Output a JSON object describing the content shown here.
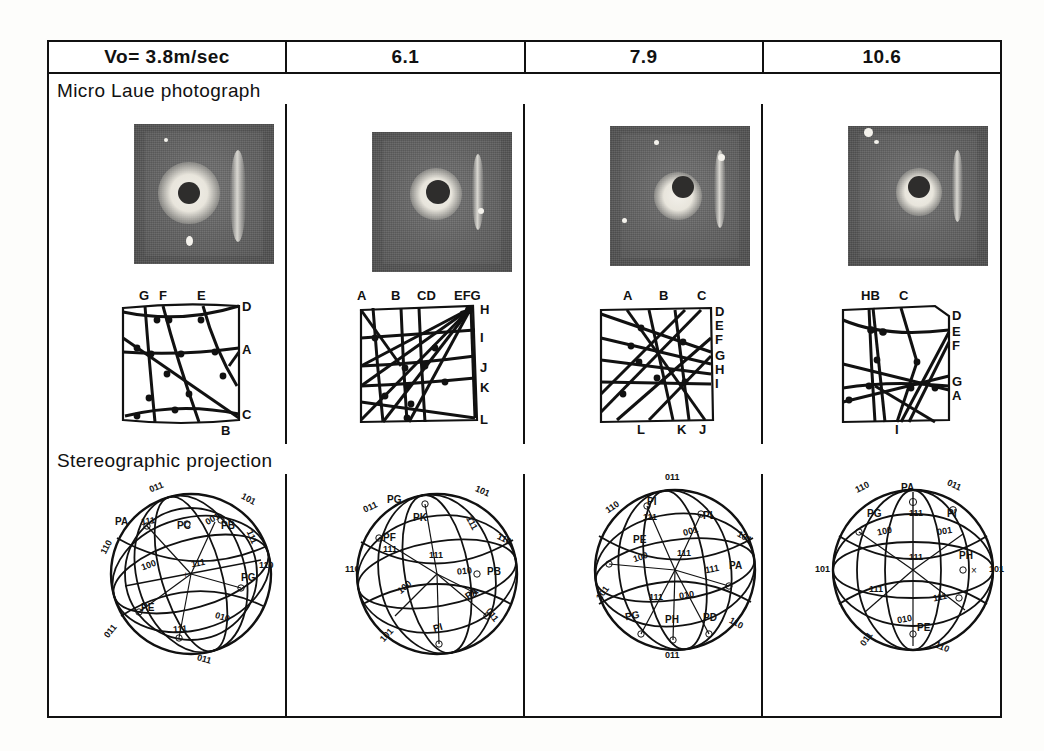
{
  "figure": {
    "columns": [
      {
        "header": "Vo= 3.8m/sec"
      },
      {
        "header": "6.1"
      },
      {
        "header": "7.9"
      },
      {
        "header": "10.6"
      }
    ],
    "row_labels": {
      "photo": "Micro Laue photograph",
      "stereo": "Stereographic projection"
    }
  },
  "laue_diagrams": [
    {
      "top": [
        "G",
        "F",
        "E"
      ],
      "right": [
        "D",
        "A",
        "C"
      ],
      "bottom": [
        "B"
      ]
    },
    {
      "top": [
        "A",
        "B",
        "CD",
        "EFG"
      ],
      "right": [
        "H",
        "I",
        "J",
        "K",
        "L"
      ],
      "bottom": []
    },
    {
      "top": [
        "A",
        "B",
        "C"
      ],
      "right": [
        "D",
        "E",
        "F",
        "G",
        "H",
        "I"
      ],
      "bottom": [
        "L",
        "K",
        "J"
      ]
    },
    {
      "top": [
        "HB",
        "C"
      ],
      "right": [
        "D",
        "E",
        "F",
        "G",
        "A"
      ],
      "bottom": [
        "I"
      ]
    }
  ],
  "stereographic": [
    {
      "poles": [
        "PA",
        "PC",
        "PB",
        "PE",
        "PG"
      ],
      "indices": [
        "011",
        "101",
        "111",
        "110",
        "100",
        "111",
        "110",
        "010",
        "111",
        "111",
        "011",
        "001"
      ]
    },
    {
      "poles": [
        "PG",
        "PK",
        "PF",
        "PB",
        "PA",
        "PI"
      ],
      "indices": [
        "011",
        "101",
        "111",
        "110",
        "110",
        "111",
        "111",
        "010",
        "100",
        "101",
        "011"
      ]
    },
    {
      "poles": [
        "PI",
        "PL",
        "PE",
        "PA",
        "PG",
        "PH",
        "PD"
      ],
      "indices": [
        "011",
        "110",
        "111",
        "001",
        "101",
        "111",
        "100",
        "111",
        "010",
        "101",
        "110",
        "011",
        "111"
      ]
    },
    {
      "poles": [
        "PA",
        "PG",
        "PI",
        "PH",
        "PE"
      ],
      "indices": [
        "110",
        "011",
        "111",
        "001",
        "100",
        "101",
        "111",
        "111",
        "111",
        "010",
        "101",
        "011",
        "110"
      ]
    }
  ]
}
